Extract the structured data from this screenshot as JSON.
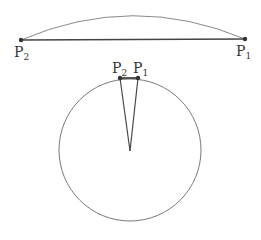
{
  "colors": {
    "arc": "#8a8a8a",
    "chord": "#444444",
    "circle": "#7a7a7a",
    "radius_lines": "#4a4a4a",
    "point": "#333333",
    "label": "#333333"
  },
  "top_figure": {
    "description": "Flat chord between two points with a shallow arc above",
    "points": [
      {
        "name": "P",
        "sub": "2",
        "x": 21,
        "y": 40
      },
      {
        "name": "P",
        "sub": "1",
        "x": 245,
        "y": 39
      }
    ],
    "arc_peak_y": 16
  },
  "bottom_figure": {
    "description": "Circle with a narrow sector; short chord between two points at the top joined to the center",
    "circle": {
      "cx": 130,
      "cy": 150,
      "r": 71
    },
    "points": [
      {
        "name": "P",
        "sub": "2",
        "x": 120,
        "y": 78
      },
      {
        "name": "P",
        "sub": "1",
        "x": 138,
        "y": 78
      }
    ],
    "center": {
      "x": 130,
      "y": 151
    }
  },
  "labels": {
    "top_left": {
      "main": "P",
      "sub": "2"
    },
    "top_right": {
      "main": "P",
      "sub": "1"
    },
    "circle_left": {
      "main": "P",
      "sub": "2"
    },
    "circle_right": {
      "main": "P",
      "sub": "1"
    }
  }
}
